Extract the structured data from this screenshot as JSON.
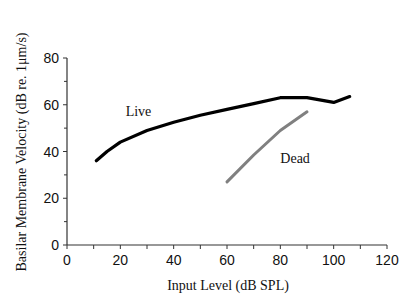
{
  "chart_data": {
    "type": "line",
    "title": "",
    "xlabel": "Input Level (dB SPL)",
    "ylabel": "Basilar Membrane Velocity (dB re. 1μm/s)",
    "xlim": [
      0,
      120
    ],
    "ylim": [
      0,
      80
    ],
    "xticks": [
      0,
      20,
      40,
      60,
      80,
      100,
      120
    ],
    "yticks": [
      0,
      20,
      40,
      60,
      80
    ],
    "grid": false,
    "legend": "inline labels",
    "series": [
      {
        "name": "Live",
        "color": "#000000",
        "x": [
          11,
          15,
          20,
          30,
          40,
          50,
          60,
          70,
          80,
          90,
          100,
          106
        ],
        "y": [
          36,
          40,
          44,
          49,
          52.5,
          55.5,
          58,
          60.5,
          63,
          63,
          61,
          63.5
        ],
        "label_pos": [
          22,
          55
        ]
      },
      {
        "name": "Dead",
        "color": "#808080",
        "x": [
          60,
          70,
          80,
          90
        ],
        "y": [
          27,
          38.5,
          49,
          57
        ],
        "label_pos": [
          80,
          35
        ]
      }
    ]
  }
}
